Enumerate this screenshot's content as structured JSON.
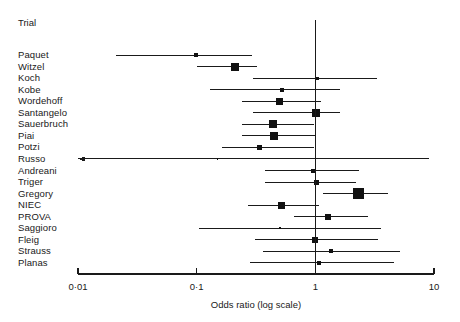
{
  "header": {
    "trial_label": "Trial"
  },
  "axis": {
    "title": "Odds ratio (log scale)",
    "tick_labels": [
      "0·01",
      "0·1",
      "1",
      "10"
    ],
    "tick_values": [
      0.01,
      0.1,
      1,
      10
    ],
    "scale": "log",
    "reference_line": 1
  },
  "style": {
    "line_color": "#1a1a1a",
    "marker_color": "#111111",
    "axis_color": "#1a1a1a",
    "background": "#ffffff"
  },
  "chart_data": {
    "type": "forest",
    "title": "",
    "xlabel": "Odds ratio (log scale)",
    "ylabel": "Trial",
    "xscale": "log",
    "xlim": [
      0.01,
      10
    ],
    "xticks": [
      0.01,
      0.1,
      1,
      10
    ],
    "xticklabels": [
      "0·01",
      "0·1",
      "1",
      "10"
    ],
    "reference_line": 1,
    "grid": false,
    "legend": "none",
    "categories": [
      "Paquet",
      "Witzel",
      "Koch",
      "Kobe",
      "Wordehoff",
      "Santangelo",
      "Sauerbruch",
      "Piai",
      "Potzi",
      "Russo",
      "Andreani",
      "Triger",
      "Gregory",
      "NIEC",
      "PROVA",
      "Saggioro",
      "Fleig",
      "Strauss",
      "Planas"
    ],
    "rows": [
      {
        "trial": "Paquet",
        "or": 0.098,
        "low": 0.021,
        "high": 0.29,
        "size": 4,
        "arrow_left": false,
        "arrow_right": false
      },
      {
        "trial": "Witzel",
        "or": 0.21,
        "low": 0.1,
        "high": 0.32,
        "size": 8,
        "arrow_left": false,
        "arrow_right": false
      },
      {
        "trial": "Koch",
        "or": 1.05,
        "low": 0.3,
        "high": 3.3,
        "size": 3,
        "arrow_left": false,
        "arrow_right": false
      },
      {
        "trial": "Kobe",
        "or": 0.52,
        "low": 0.13,
        "high": 1.6,
        "size": 4,
        "arrow_left": false,
        "arrow_right": false
      },
      {
        "trial": "Wordehoff",
        "or": 0.5,
        "low": 0.24,
        "high": 1.12,
        "size": 7,
        "arrow_left": false,
        "arrow_right": false
      },
      {
        "trial": "Santangelo",
        "or": 1.02,
        "low": 0.3,
        "high": 1.62,
        "size": 8,
        "arrow_left": false,
        "arrow_right": false
      },
      {
        "trial": "Sauerbruch",
        "or": 0.44,
        "low": 0.24,
        "high": 0.97,
        "size": 8,
        "arrow_left": false,
        "arrow_right": false
      },
      {
        "trial": "Piai",
        "or": 0.45,
        "low": 0.24,
        "high": 1.0,
        "size": 8,
        "arrow_left": false,
        "arrow_right": false
      },
      {
        "trial": "Potzi",
        "or": 0.34,
        "low": 0.165,
        "high": 0.97,
        "size": 5,
        "arrow_left": false,
        "arrow_right": false
      },
      {
        "trial": "Russo",
        "or": 0.15,
        "low": 0.01,
        "high": 9.0,
        "size": 1.6,
        "arrow_left": true,
        "arrow_right": false
      },
      {
        "trial": "Andreani",
        "or": 0.96,
        "low": 0.38,
        "high": 2.35,
        "size": 4,
        "arrow_left": false,
        "arrow_right": false
      },
      {
        "trial": "Triger",
        "or": 1.03,
        "low": 0.38,
        "high": 2.2,
        "size": 5,
        "arrow_left": false,
        "arrow_right": false
      },
      {
        "trial": "Gregory",
        "or": 2.3,
        "low": 1.15,
        "high": 4.1,
        "size": 11,
        "arrow_left": false,
        "arrow_right": false
      },
      {
        "trial": "NIEC",
        "or": 0.52,
        "low": 0.27,
        "high": 1.07,
        "size": 7,
        "arrow_left": false,
        "arrow_right": false
      },
      {
        "trial": "PROVA",
        "or": 1.28,
        "low": 0.66,
        "high": 2.8,
        "size": 6,
        "arrow_left": false,
        "arrow_right": false
      },
      {
        "trial": "Saggioro",
        "or": 0.5,
        "low": 0.105,
        "high": 3.6,
        "size": 2,
        "arrow_left": false,
        "arrow_right": false
      },
      {
        "trial": "Fleig",
        "or": 1.0,
        "low": 0.31,
        "high": 3.4,
        "size": 6,
        "arrow_left": false,
        "arrow_right": false
      },
      {
        "trial": "Strauss",
        "or": 1.35,
        "low": 0.36,
        "high": 5.2,
        "size": 4,
        "arrow_left": false,
        "arrow_right": false
      },
      {
        "trial": "Planas",
        "or": 1.08,
        "low": 0.28,
        "high": 4.6,
        "size": 4,
        "arrow_left": false,
        "arrow_right": false
      }
    ]
  },
  "geometry": {
    "x_at_001": 78,
    "x_at_10": 434,
    "row_start_y": 55,
    "row_step": 11.55,
    "vline_top": 20,
    "vline_bottom": 272,
    "axis_y": 274
  }
}
